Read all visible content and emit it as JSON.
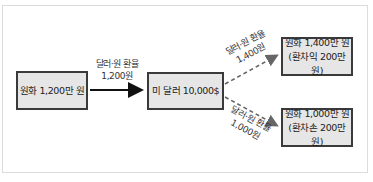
{
  "diagram": {
    "source": {
      "label": "원화 1,200만 원"
    },
    "middle": {
      "label": "미 달러 10,000$"
    },
    "edge_main": {
      "line1": "달러·원 환율",
      "line2": "1,200원"
    },
    "edge_up": {
      "line1": "달러·원 환율",
      "line2": "1,400원"
    },
    "edge_down": {
      "line1": "달러·원 환율",
      "line2": "1,000원"
    },
    "result_gain": {
      "line1": "원화 1,400만 원",
      "line2": "(환차익 200만 원)"
    },
    "result_loss": {
      "line1": "원화 1,000만 원",
      "line2": "(환차손 200만 원)"
    }
  },
  "colors": {
    "box_fill": "#e6e6e6",
    "box_border": "#3a3a3a",
    "dashed_arrow": "#666666",
    "solid_arrow": "#111111"
  }
}
